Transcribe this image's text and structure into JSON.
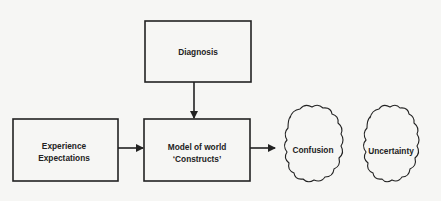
{
  "diagram": {
    "nodes": [
      {
        "id": "diagnosis",
        "shape": "box",
        "lines": [
          "Diagnosis"
        ]
      },
      {
        "id": "experience",
        "shape": "box",
        "lines": [
          "Experience",
          "Expectations"
        ]
      },
      {
        "id": "model",
        "shape": "box",
        "lines": [
          "Model of world",
          "‘Constructs’"
        ]
      },
      {
        "id": "confusion",
        "shape": "cloud",
        "lines": [
          "Confusion"
        ]
      },
      {
        "id": "uncertainty",
        "shape": "cloud",
        "lines": [
          "Uncertainty"
        ]
      }
    ],
    "edges": [
      {
        "from": "diagnosis",
        "to": "model"
      },
      {
        "from": "experience",
        "to": "model"
      },
      {
        "from": "model",
        "to": "confusion"
      }
    ],
    "colors": {
      "stroke": "#222222",
      "background": "#f6f6f4",
      "text": "#222222"
    }
  }
}
